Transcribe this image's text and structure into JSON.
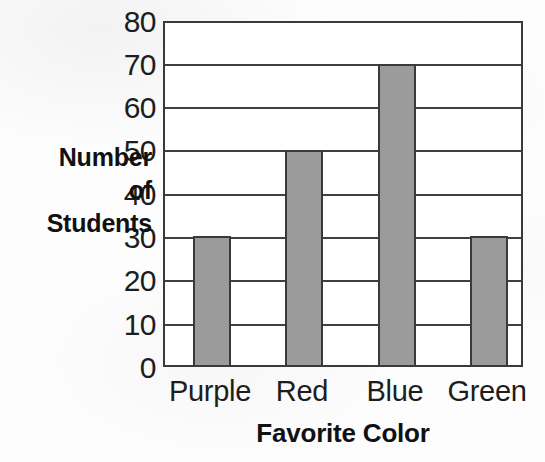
{
  "chart_data": {
    "type": "bar",
    "title": "",
    "subtitle": "",
    "xlabel": "Favorite Color",
    "ylabel": "Number of Students",
    "ylabel_lines": [
      "Number",
      "of",
      "Students"
    ],
    "categories": [
      "Purple",
      "Red",
      "Blue",
      "Green"
    ],
    "values": [
      30,
      50,
      70,
      30
    ],
    "ylim": [
      0,
      80
    ],
    "ytick_labels": [
      "80",
      "70",
      "60",
      "50",
      "40",
      "30",
      "20",
      "10",
      "0"
    ],
    "ytick_values": [
      80,
      70,
      60,
      50,
      40,
      30,
      20,
      10,
      0
    ],
    "ystep": 10,
    "grid": true,
    "grid_axis": "y",
    "legend": false,
    "legend_position": "none",
    "bar_fill_color": "#9b9b9b",
    "bar_edge_color": "#3a3a3a",
    "axis_color": "#3a3a3a",
    "background_color": "#ffffff",
    "text_color": "#1d1d1d",
    "bars": [
      {
        "category": "Purple",
        "value": 30,
        "left": 191,
        "width": 38
      },
      {
        "category": "Red",
        "value": 50,
        "left": 283,
        "width": 38
      },
      {
        "category": "Blue",
        "value": 70,
        "left": 376,
        "width": 38
      },
      {
        "category": "Green",
        "value": 30,
        "left": 468,
        "width": 38
      }
    ]
  },
  "layout": {
    "plot_left": 163,
    "plot_top": 21,
    "plot_width": 360,
    "plot_height": 346,
    "label_centers": [
      210,
      302,
      395,
      487
    ]
  }
}
